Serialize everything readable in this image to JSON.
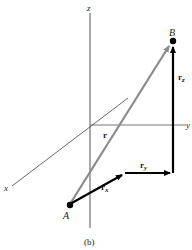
{
  "figure": {
    "caption": "(b)",
    "axes": {
      "x_label": "x",
      "y_label": "y",
      "z_label": "z"
    },
    "points": {
      "A": {
        "label": "A"
      },
      "B": {
        "label": "B"
      }
    },
    "vectors": {
      "r": {
        "label": "r",
        "color": "#8a8a8a"
      },
      "r_x": {
        "label": "r",
        "subscript": "x",
        "color": "#000000"
      },
      "r_y": {
        "label": "r",
        "subscript": "y",
        "color": "#000000"
      },
      "r_z": {
        "label": "r",
        "subscript": "z",
        "color": "#000000"
      }
    },
    "colors": {
      "axis": "#555555",
      "component_vectors": "#000000",
      "resultant_vector": "#8a8a8a"
    }
  }
}
